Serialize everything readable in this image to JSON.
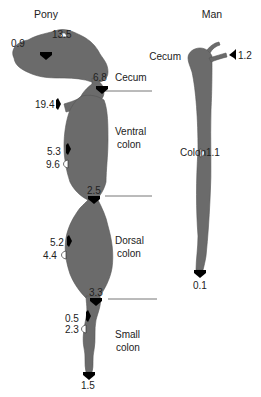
{
  "colors": {
    "organ": "#6b6b6b",
    "background": "#ffffff",
    "absorption_arrow": "#000000",
    "secretion_arrow": "#ffffff",
    "divider": "#777777"
  },
  "pony": {
    "title": "Pony",
    "segments": {
      "cecum": "Cecum",
      "ventral_colon_1": "Ventral",
      "ventral_colon_2": "colon",
      "dorsal_colon_1": "Dorsal",
      "dorsal_colon_2": "colon",
      "small_colon_1": "Small",
      "small_colon_2": "colon"
    },
    "values": {
      "cecum_in_top": "0.9",
      "cecum_out_top": "13.5",
      "cecum_exit": "6.8",
      "ileum_inflow": "19.4",
      "ventral_in": "5.3",
      "ventral_out": "9.6",
      "ventral_exit": "2.5",
      "dorsal_in": "5.2",
      "dorsal_out": "4.4",
      "dorsal_exit": "3.3",
      "small_in": "0.5",
      "small_out": "2.3",
      "fecal": "1.5"
    }
  },
  "man": {
    "title": "Man",
    "segments": {
      "cecum": "Cecum",
      "colon": "Colon"
    },
    "values": {
      "ileum_inflow": "1.2",
      "colon_out": "1.1",
      "fecal": "0.1"
    }
  }
}
